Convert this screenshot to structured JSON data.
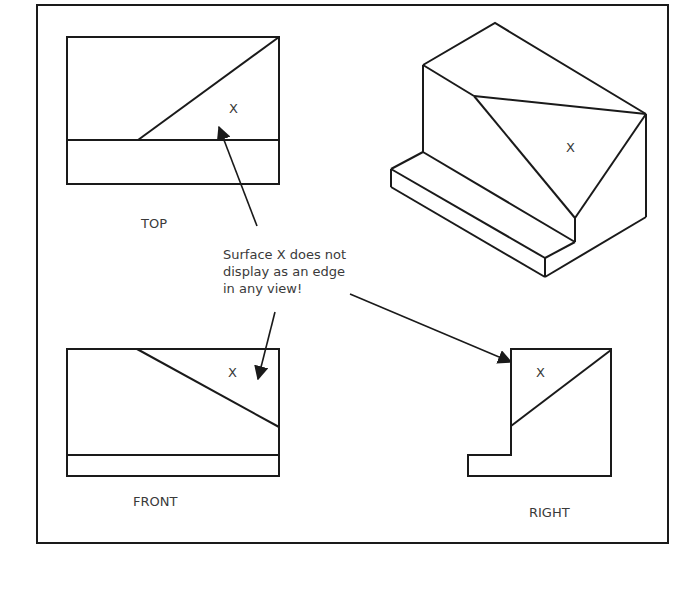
{
  "figure": {
    "views": {
      "top": {
        "label": "TOP",
        "surface_label": "X"
      },
      "front": {
        "label": "FRONT",
        "surface_label": "X"
      },
      "right": {
        "label": "RIGHT",
        "surface_label": "X"
      },
      "isometric": {
        "surface_label": "X"
      }
    },
    "annotation": {
      "lines": [
        "Surface X does not",
        "display as an edge",
        "in any view!"
      ]
    },
    "colors": {
      "line": "#1a1a1a",
      "text": "#3a3a3a",
      "background": "#ffffff"
    }
  }
}
